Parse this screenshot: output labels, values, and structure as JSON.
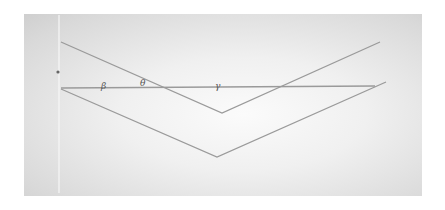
{
  "diagram": {
    "type": "geometry",
    "colors": {
      "line": "#9a9a9a",
      "frame_edge": "#cfcfcf",
      "label": "#555555",
      "guide": "#f7f7f7"
    },
    "labels": [
      {
        "id": "beta",
        "text": "β",
        "x": 103,
        "y": 88
      },
      {
        "id": "theta",
        "text": "θ",
        "x": 143,
        "y": 85
      },
      {
        "id": "gamma",
        "text": "γ",
        "x": 217,
        "y": 88
      }
    ],
    "point": {
      "x": 58,
      "y": 72
    },
    "lines": {
      "upper_v": [
        [
          61,
          42
        ],
        [
          222,
          113
        ],
        [
          380,
          42
        ]
      ],
      "horizontal": [
        [
          61,
          88
        ],
        [
          375,
          86
        ]
      ],
      "lower_v": [
        [
          61,
          89
        ],
        [
          217,
          157
        ],
        [
          386,
          82
        ]
      ],
      "vertical_guide": [
        [
          59,
          15
        ],
        [
          59,
          193
        ]
      ]
    }
  }
}
